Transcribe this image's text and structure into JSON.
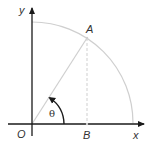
{
  "diagram": {
    "labels": {
      "y_axis": "y",
      "x_axis": "x",
      "origin": "O",
      "point_a": "A",
      "point_b": "B",
      "angle": "θ"
    },
    "colors": {
      "axis": "#1a1a1a",
      "arc": "#c8c8c8",
      "segment": "#c8c8c8",
      "dashed": "#c8c8c8",
      "angle_arrow": "#1a1a1a"
    }
  }
}
